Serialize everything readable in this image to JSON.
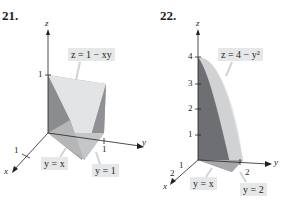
{
  "figures": [
    {
      "number": "21.",
      "surface_label": "z = 1 − xy",
      "axes": {
        "x": "x",
        "y": "y",
        "z": "z"
      },
      "ticks": {
        "z": "1",
        "x": "1",
        "y": "1"
      },
      "boundary_labels": [
        "y = x",
        "y = 1"
      ]
    },
    {
      "number": "22.",
      "surface_label": "z = 4 − y²",
      "axes": {
        "x": "x",
        "y": "y",
        "z": "z"
      },
      "ticks": {
        "z": [
          "1",
          "2",
          "3",
          "4"
        ],
        "x": [
          "1",
          "2"
        ],
        "y": "2"
      },
      "boundary_labels": [
        "y = x",
        "y = 2"
      ]
    }
  ],
  "colors": {
    "label_bg": "#e6e7e8",
    "solid_dark": "#8a8c8e",
    "solid_mid": "#b1b3b6",
    "solid_light": "#d1d3d4",
    "solid_top": "#e8e9ea",
    "axis": "#231f20"
  }
}
